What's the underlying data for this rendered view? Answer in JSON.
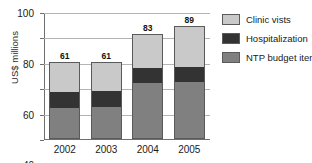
{
  "caption_fragment": "",
  "chart_data": {
    "type": "bar",
    "stacked": true,
    "title": "",
    "xlabel": "",
    "ylabel": "US$ millions",
    "ylim": [
      0,
      100
    ],
    "ytick_step": 20,
    "yticks": [
      0,
      20,
      40,
      60,
      80,
      100
    ],
    "ytick_labels": [
      "0",
      "20",
      "40",
      "60",
      "80",
      "100"
    ],
    "grid": true,
    "legend_position": "right",
    "categories": [
      "2002",
      "2003",
      "2004",
      "2005"
    ],
    "totals": [
      61,
      61,
      83,
      89
    ],
    "total_labels": [
      "61",
      "61",
      "83",
      "89"
    ],
    "series": [
      {
        "name": "NTP budget items",
        "color": "#808080",
        "values": [
          24,
          25,
          44,
          45
        ]
      },
      {
        "name": "Hospitalization",
        "color": "#333333",
        "values": [
          13,
          13,
          12,
          12
        ]
      },
      {
        "name": "Clinic vists",
        "color": "#c9c9c9",
        "values": [
          24,
          23,
          27,
          32
        ]
      }
    ],
    "legend": [
      {
        "label": "Clinic vists",
        "color": "#c9c9c9"
      },
      {
        "label": "Hospitalization",
        "color": "#333333"
      },
      {
        "label": "NTP budget items",
        "color": "#808080"
      }
    ]
  }
}
